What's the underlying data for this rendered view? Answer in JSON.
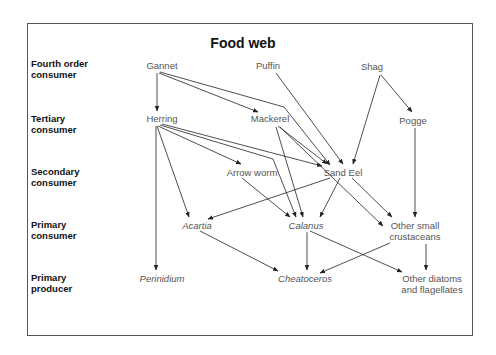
{
  "title": "Food web",
  "levels": [
    {
      "line1": "Fourth order",
      "line2": "consumer"
    },
    {
      "line1": "Tertiary",
      "line2": "consumer"
    },
    {
      "line1": "Secondary",
      "line2": "consumer"
    },
    {
      "line1": "Primary",
      "line2": "consumer"
    },
    {
      "line1": "Primary",
      "line2": "producer"
    }
  ],
  "nodes": {
    "gannet": {
      "label": "Gannet",
      "level": "Fourth order consumer"
    },
    "puffin": {
      "label": "Puffin",
      "level": "Fourth order consumer"
    },
    "shag": {
      "label": "Shag",
      "level": "Fourth order consumer"
    },
    "herring": {
      "label": "Herring",
      "level": "Tertiary consumer"
    },
    "mackerel": {
      "label": "Mackerel",
      "level": "Tertiary consumer"
    },
    "pogge": {
      "label": "Pogge",
      "level": "Tertiary consumer"
    },
    "arrow_worm": {
      "label": "Arrow worm",
      "level": "Secondary consumer"
    },
    "sand_eel": {
      "label": "Sand Eel",
      "level": "Secondary consumer"
    },
    "acartia": {
      "label": "Acartia",
      "level": "Primary consumer"
    },
    "calanus": {
      "label": "Calanus",
      "level": "Primary consumer"
    },
    "other_small_crustaceans": {
      "line1": "Other small",
      "line2": "crustaceans",
      "level": "Primary consumer"
    },
    "perinidium": {
      "label": "Perinidium",
      "level": "Primary producer"
    },
    "cheatoceros": {
      "label": "Cheatoceros",
      "level": "Primary producer"
    },
    "other_diatoms": {
      "line1": "Other diatoms",
      "line2": "and flagellates",
      "level": "Primary producer"
    }
  },
  "edges": [
    {
      "from": "Gannet",
      "to": "Herring"
    },
    {
      "from": "Gannet",
      "to": "Mackerel"
    },
    {
      "from": "Gannet",
      "to": "Sand Eel"
    },
    {
      "from": "Puffin",
      "to": "Sand Eel"
    },
    {
      "from": "Shag",
      "to": "Sand Eel"
    },
    {
      "from": "Shag",
      "to": "Pogge"
    },
    {
      "from": "Herring",
      "to": "Arrow worm"
    },
    {
      "from": "Herring",
      "to": "Sand Eel"
    },
    {
      "from": "Herring",
      "to": "Calanus"
    },
    {
      "from": "Herring",
      "to": "Acartia"
    },
    {
      "from": "Herring",
      "to": "Perinidium"
    },
    {
      "from": "Mackerel",
      "to": "Sand Eel"
    },
    {
      "from": "Mackerel",
      "to": "Calanus"
    },
    {
      "from": "Mackerel",
      "to": "Other small crustaceans"
    },
    {
      "from": "Pogge",
      "to": "Other small crustaceans"
    },
    {
      "from": "Arrow worm",
      "to": "Calanus"
    },
    {
      "from": "Sand Eel",
      "to": "Acartia"
    },
    {
      "from": "Sand Eel",
      "to": "Calanus"
    },
    {
      "from": "Sand Eel",
      "to": "Other small crustaceans"
    },
    {
      "from": "Acartia",
      "to": "Cheatoceros"
    },
    {
      "from": "Calanus",
      "to": "Cheatoceros"
    },
    {
      "from": "Calanus",
      "to": "Other diatoms and flagellates"
    },
    {
      "from": "Other small crustaceans",
      "to": "Cheatoceros"
    },
    {
      "from": "Other small crustaceans",
      "to": "Other diatoms and flagellates"
    }
  ],
  "colors": {
    "line": "#222222",
    "node_text": "#555555",
    "label_text": "#111111",
    "border": "#555555"
  }
}
